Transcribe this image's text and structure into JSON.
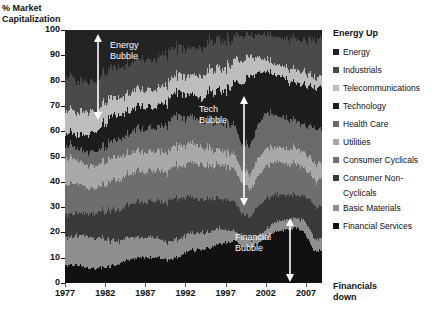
{
  "chart_data": {
    "type": "area",
    "title": "",
    "ylabel": "% Market Capitalization",
    "xlabel": "",
    "ylim": [
      0,
      100
    ],
    "xlim": [
      1977,
      2009
    ],
    "grid": false,
    "stacked": true,
    "stack_order": "bottom-to-top",
    "legend_position": "right",
    "x": [
      1977,
      1978,
      1979,
      1980,
      1981,
      1982,
      1983,
      1984,
      1985,
      1986,
      1987,
      1988,
      1989,
      1990,
      1991,
      1992,
      1993,
      1994,
      1995,
      1996,
      1997,
      1998,
      1999,
      2000,
      2001,
      2002,
      2003,
      2004,
      2005,
      2006,
      2007,
      2008,
      2009
    ],
    "ytick_labels": [
      "0",
      "10",
      "20",
      "30",
      "40",
      "50",
      "60",
      "70",
      "80",
      "90",
      "100"
    ],
    "ytick_values": [
      0,
      10,
      20,
      30,
      40,
      50,
      60,
      70,
      80,
      90,
      100
    ],
    "xtick_labels": [
      "1977",
      "1982",
      "1987",
      "1992",
      "1997",
      "2002",
      "2007"
    ],
    "xtick_values": [
      1977,
      1982,
      1987,
      1992,
      1997,
      2002,
      2007
    ],
    "series": [
      {
        "name": "Financial Services",
        "color": "#111111",
        "values": [
          7,
          7,
          7,
          6,
          6,
          6,
          7,
          8,
          9,
          10,
          10,
          10,
          10,
          9,
          10,
          12,
          13,
          13,
          14,
          15,
          16,
          17,
          15,
          14,
          16,
          18,
          20,
          21,
          21,
          22,
          19,
          12,
          13
        ]
      },
      {
        "name": "Basic Materials",
        "color": "#8e8e8e",
        "values": [
          11,
          11,
          12,
          13,
          12,
          11,
          10,
          9,
          9,
          8,
          8,
          8,
          7,
          7,
          7,
          7,
          7,
          7,
          6,
          6,
          5,
          4,
          4,
          3,
          3,
          3,
          4,
          4,
          4,
          4,
          5,
          5,
          5
        ]
      },
      {
        "name": "Consumer Non-Cyclicals",
        "color": "#3a3a3a",
        "values": [
          9,
          9,
          9,
          9,
          10,
          11,
          12,
          12,
          13,
          14,
          14,
          14,
          15,
          16,
          16,
          15,
          14,
          13,
          13,
          12,
          12,
          12,
          9,
          9,
          11,
          12,
          11,
          10,
          10,
          9,
          10,
          13,
          12
        ]
      },
      {
        "name": "Consumer Cyclicals",
        "color": "#6e6e6e",
        "values": [
          12,
          12,
          11,
          10,
          10,
          11,
          12,
          12,
          12,
          12,
          12,
          12,
          12,
          12,
          13,
          13,
          14,
          14,
          13,
          13,
          13,
          13,
          12,
          11,
          12,
          13,
          13,
          13,
          12,
          12,
          11,
          10,
          11
        ]
      },
      {
        "name": "Utilities",
        "color": "#a9a9a9",
        "values": [
          10,
          10,
          9,
          9,
          9,
          9,
          9,
          9,
          8,
          8,
          8,
          8,
          8,
          8,
          8,
          8,
          8,
          7,
          7,
          6,
          6,
          6,
          5,
          6,
          7,
          7,
          6,
          6,
          6,
          6,
          6,
          7,
          6
        ]
      },
      {
        "name": "Health Care",
        "color": "#6a6a6a",
        "values": [
          5,
          5,
          5,
          5,
          6,
          6,
          7,
          7,
          8,
          9,
          9,
          9,
          10,
          11,
          12,
          11,
          10,
          10,
          11,
          11,
          11,
          12,
          10,
          11,
          13,
          14,
          13,
          12,
          12,
          11,
          11,
          14,
          13
        ]
      },
      {
        "name": "Technology",
        "color": "#1d1d1d",
        "values": [
          5,
          5,
          6,
          7,
          8,
          9,
          10,
          9,
          9,
          9,
          9,
          8,
          9,
          9,
          9,
          9,
          9,
          9,
          11,
          12,
          13,
          16,
          24,
          28,
          21,
          16,
          16,
          16,
          15,
          15,
          16,
          16,
          17
        ]
      },
      {
        "name": "Telecommunications",
        "color": "#bdbdbd",
        "values": [
          9,
          9,
          9,
          9,
          8,
          8,
          7,
          7,
          7,
          7,
          7,
          7,
          7,
          7,
          7,
          7,
          8,
          9,
          9,
          9,
          9,
          9,
          9,
          8,
          6,
          5,
          4,
          4,
          5,
          5,
          5,
          4,
          4
        ]
      },
      {
        "name": "Industrials",
        "color": "#4a4a4a",
        "values": [
          13,
          13,
          12,
          12,
          12,
          12,
          12,
          12,
          12,
          12,
          12,
          12,
          12,
          12,
          11,
          11,
          11,
          11,
          11,
          11,
          11,
          9,
          10,
          8,
          9,
          10,
          11,
          11,
          12,
          12,
          13,
          15,
          15
        ]
      },
      {
        "name": "Energy",
        "color": "#232323",
        "values": [
          19,
          19,
          20,
          20,
          19,
          17,
          14,
          15,
          13,
          11,
          11,
          12,
          10,
          9,
          7,
          7,
          6,
          7,
          5,
          5,
          4,
          2,
          2,
          2,
          2,
          2,
          2,
          3,
          3,
          4,
          4,
          4,
          4
        ]
      }
    ],
    "annotations": [
      {
        "id": "energy-bubble",
        "text_line1": "Energy",
        "text_line2": "Bubble",
        "arrow": "double-vertical"
      },
      {
        "id": "tech-bubble",
        "text_line1": "Tech",
        "text_line2": "Bubble",
        "arrow": "double-vertical"
      },
      {
        "id": "financial-bubble",
        "text_line1": "Financial",
        "text_line2": "Bubble",
        "arrow": "double-vertical"
      }
    ]
  },
  "legend": {
    "header": "Energy Up",
    "footer_line1": "Financials",
    "footer_line2": "down",
    "items": [
      {
        "label": "Energy",
        "color": "#232323"
      },
      {
        "label": "Industrials",
        "color": "#4a4a4a"
      },
      {
        "label": "Telecommunications",
        "color": "#bdbdbd"
      },
      {
        "label": "Technology",
        "color": "#1d1d1d"
      },
      {
        "label": "Health Care",
        "color": "#6a6a6a"
      },
      {
        "label": "Utilities",
        "color": "#a9a9a9"
      },
      {
        "label": "Consumer Cyclicals",
        "color": "#6e6e6e"
      },
      {
        "label": "Consumer Non-",
        "color": "#3a3a3a"
      },
      {
        "label": "Cyclicals",
        "color": ""
      },
      {
        "label": "Basic Materials",
        "color": "#8e8e8e"
      },
      {
        "label": "Financial Services",
        "color": "#111111"
      }
    ]
  }
}
